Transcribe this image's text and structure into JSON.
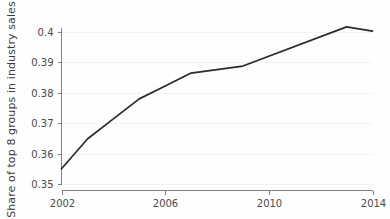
{
  "chart_data": {
    "type": "line",
    "title": "",
    "xlabel": "",
    "ylabel": "Share of top 8 groups in industry sales",
    "x": [
      2002,
      2003,
      2004,
      2005,
      2006,
      2007,
      2009,
      2013,
      2014
    ],
    "values": [
      0.355,
      0.3648,
      0.3714,
      0.378,
      0.3822,
      0.3865,
      0.3888,
      0.4017,
      0.4003
    ],
    "series": [
      {
        "name": "Share of top 8 groups in industry sales",
        "values": [
          0.355,
          0.3648,
          0.3714,
          0.378,
          0.3822,
          0.3865,
          0.3888,
          0.4017,
          0.4003
        ]
      }
    ],
    "xlim": [
      2002,
      2014
    ],
    "ylim": [
      0.35,
      0.403
    ],
    "xticks": [
      2002,
      2006,
      2010,
      2014
    ],
    "xtick_labels": [
      "2002",
      "2006",
      "2010",
      "2014"
    ],
    "yticks": [
      0.35,
      0.36,
      0.37,
      0.38,
      0.39,
      0.4
    ],
    "ytick_labels": [
      "0.35",
      "0.36",
      "0.37",
      "0.38",
      "0.39",
      "0.4"
    ],
    "grid": true,
    "legend": null,
    "line_color": "#2b2b2b",
    "axis_color": "#808080",
    "grid_color": "#f2f2f2",
    "background_color": "#fefefe"
  },
  "axes": {
    "y_axis_title": "Share of top 8 groups in industry sales"
  }
}
